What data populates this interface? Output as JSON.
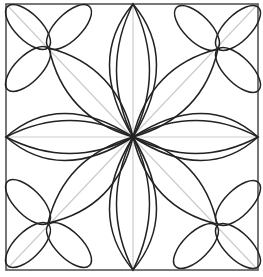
{
  "diagram": {
    "type": "geometric-rosette-pattern",
    "colors": {
      "background": "#ffffff",
      "border": "#555555",
      "stroke": "#222222",
      "guide": "#cccccc"
    },
    "frame": {
      "x1": 6,
      "y1": 4,
      "x2": 258,
      "y2": 270
    },
    "center": {
      "x": 133,
      "y": 137
    },
    "clover_centers": [
      {
        "name": "top-left",
        "x": 49,
        "y": 48
      },
      {
        "name": "top-right",
        "x": 218,
        "y": 49
      },
      {
        "name": "bottom-left",
        "x": 48,
        "y": 223
      },
      {
        "name": "bottom-right",
        "x": 217,
        "y": 224
      }
    ]
  }
}
